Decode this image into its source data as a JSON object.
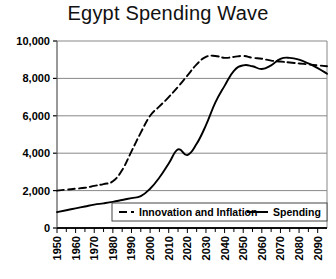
{
  "chart_data": {
    "type": "line",
    "title": "Egypt Spending Wave",
    "xlabel": "",
    "ylabel": "",
    "grid": true,
    "legend_position": "bottom-right",
    "xlim": [
      1950,
      2095
    ],
    "ylim": [
      0,
      10000
    ],
    "ytick_labels": [
      "0",
      "2,000",
      "4,000",
      "6,000",
      "8,000",
      "10,000"
    ],
    "ytick_values": [
      0,
      2000,
      4000,
      6000,
      8000,
      10000
    ],
    "xtick_labels": [
      "1950",
      "1960",
      "1970",
      "1980",
      "1990",
      "2000",
      "2010",
      "2020",
      "2030",
      "2040",
      "2050",
      "2060",
      "2070",
      "2080",
      "2090"
    ],
    "xtick_values": [
      1950,
      1960,
      1970,
      1980,
      1990,
      2000,
      2010,
      2020,
      2030,
      2040,
      2050,
      2060,
      2070,
      2080,
      2090
    ],
    "minor_tick_step": 5,
    "x": [
      1950,
      1955,
      1960,
      1965,
      1970,
      1975,
      1980,
      1985,
      1990,
      1995,
      2000,
      2005,
      2010,
      2015,
      2020,
      2025,
      2030,
      2035,
      2040,
      2045,
      2050,
      2055,
      2060,
      2065,
      2070,
      2075,
      2080,
      2085,
      2090,
      2095
    ],
    "series": [
      {
        "name": "Innovation and Inflation",
        "style": "dashed",
        "color": "#000000",
        "values": [
          2000,
          2050,
          2100,
          2150,
          2250,
          2350,
          2500,
          3100,
          4100,
          5100,
          6000,
          6500,
          7000,
          7550,
          8150,
          8750,
          9150,
          9200,
          9100,
          9150,
          9200,
          9100,
          9050,
          8950,
          8900,
          8850,
          8800,
          8750,
          8700,
          8650
        ]
      },
      {
        "name": "Spending",
        "style": "solid",
        "color": "#000000",
        "values": [
          850,
          950,
          1050,
          1150,
          1250,
          1320,
          1400,
          1500,
          1600,
          1700,
          2100,
          2700,
          3450,
          4200,
          3900,
          4500,
          5500,
          6700,
          7600,
          8400,
          8700,
          8650,
          8500,
          8700,
          9050,
          9100,
          9000,
          8800,
          8550,
          8250
        ]
      }
    ],
    "legend": [
      {
        "label": "Innovation and Inflation",
        "style": "dashed"
      },
      {
        "label": "Spending",
        "style": "solid"
      }
    ]
  }
}
